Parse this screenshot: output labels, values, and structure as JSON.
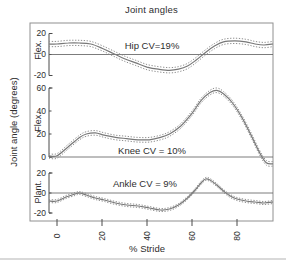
{
  "chart_data": {
    "type": "line",
    "title": "Joint angles",
    "xlabel": "% Stride",
    "ylabel": "Joint angle (degrees)",
    "x_ticks": [
      0,
      20,
      40,
      60,
      80
    ],
    "x_range": [
      0,
      96
    ],
    "grid": false,
    "legend": "none",
    "layout_hints": {
      "x_tick_labels_rotated_90": true,
      "three_stacked_subplots_share_x": true,
      "band_style": "dotted lines show mean plus/minus SD around solid mean"
    },
    "line_color": "#787878",
    "band_color": "#8f8f8f",
    "frame_color": "#909090",
    "subplots": [
      {
        "name": "hip",
        "side_label": "Flex.",
        "annotation": "Hip CV=19%",
        "cv_percent": 19,
        "y_ticks": [
          20,
          0,
          -20
        ],
        "y_range": [
          -20,
          20
        ],
        "sd": 2.5,
        "mean": [
          [
            0,
            10
          ],
          [
            5,
            11
          ],
          [
            10,
            11
          ],
          [
            15,
            10
          ],
          [
            20,
            6
          ],
          [
            25,
            1
          ],
          [
            30,
            -4
          ],
          [
            35,
            -8
          ],
          [
            40,
            -12
          ],
          [
            45,
            -14
          ],
          [
            50,
            -15
          ],
          [
            54,
            -14
          ],
          [
            58,
            -11
          ],
          [
            62,
            -5
          ],
          [
            66,
            2
          ],
          [
            70,
            8
          ],
          [
            74,
            12
          ],
          [
            79,
            13
          ],
          [
            84,
            12
          ],
          [
            88,
            10
          ],
          [
            92,
            9
          ],
          [
            96,
            10
          ]
        ]
      },
      {
        "name": "knee",
        "side_label": "Flex.",
        "annotation": "Knee CV = 10%",
        "cv_percent": 10,
        "y_ticks": [
          60,
          40,
          20,
          0
        ],
        "y_range": [
          0,
          60
        ],
        "sd": 2,
        "mean": [
          [
            0,
            1
          ],
          [
            5,
            9
          ],
          [
            10,
            17
          ],
          [
            13,
            20
          ],
          [
            17,
            21
          ],
          [
            21,
            19
          ],
          [
            26,
            17
          ],
          [
            31,
            16
          ],
          [
            36,
            15
          ],
          [
            41,
            15
          ],
          [
            46,
            17
          ],
          [
            50,
            20
          ],
          [
            55,
            27
          ],
          [
            60,
            38
          ],
          [
            64,
            49
          ],
          [
            68,
            56
          ],
          [
            71,
            58
          ],
          [
            74,
            55
          ],
          [
            78,
            47
          ],
          [
            82,
            35
          ],
          [
            86,
            20
          ],
          [
            90,
            4
          ],
          [
            93,
            -5
          ],
          [
            96,
            -6
          ]
        ]
      },
      {
        "name": "ankle",
        "side_label": "Plant.",
        "annotation": "Ankle CV = 9%",
        "cv_percent": 9,
        "y_ticks": [
          20,
          0,
          -20
        ],
        "y_range": [
          -20,
          20
        ],
        "sd": 1.5,
        "mean": [
          [
            0,
            -8
          ],
          [
            4,
            -4
          ],
          [
            8,
            -1
          ],
          [
            10,
            0
          ],
          [
            13,
            -2
          ],
          [
            17,
            -5
          ],
          [
            21,
            -7
          ],
          [
            26,
            -10
          ],
          [
            31,
            -12
          ],
          [
            36,
            -13
          ],
          [
            41,
            -15
          ],
          [
            46,
            -17
          ],
          [
            50,
            -16
          ],
          [
            54,
            -12
          ],
          [
            58,
            -5
          ],
          [
            61,
            2
          ],
          [
            64,
            10
          ],
          [
            66,
            14
          ],
          [
            68,
            13
          ],
          [
            71,
            8
          ],
          [
            74,
            2
          ],
          [
            77,
            -3
          ],
          [
            80,
            -6
          ],
          [
            84,
            -8
          ],
          [
            88,
            -9
          ],
          [
            92,
            -10
          ],
          [
            96,
            -9
          ]
        ]
      }
    ]
  }
}
